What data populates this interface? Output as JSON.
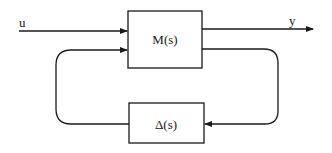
{
  "diagram": {
    "type": "block-diagram",
    "title": "",
    "blocks": [
      {
        "id": "M",
        "label": "M(s)"
      },
      {
        "id": "Delta",
        "label": "Δ(s)"
      }
    ],
    "signals": {
      "input": "u",
      "output": "y"
    },
    "edges": [
      {
        "from": "u",
        "to": "M"
      },
      {
        "from": "M",
        "to": "y"
      },
      {
        "from": "M",
        "to": "Delta",
        "route": "right-loop-down"
      },
      {
        "from": "Delta",
        "to": "M",
        "route": "left-loop-up"
      }
    ],
    "colors": {
      "stroke": "#1a1a1a",
      "background": "#ffffff"
    }
  }
}
